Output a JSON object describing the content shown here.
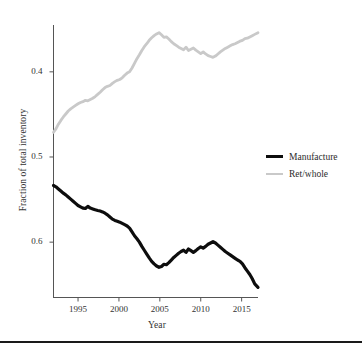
{
  "figure": {
    "background_color": "#ffffff",
    "bottom_rule_color": "#1a1a1a"
  },
  "axes": {
    "y_title": "Fraction of total inventory",
    "x_title": "Year",
    "y_ticks": [
      "0.6",
      "0.5",
      "0.4"
    ],
    "x_ticks": [
      "1995",
      "2000",
      "2005",
      "2010",
      "2015"
    ],
    "axis_color": "#555555"
  },
  "legend": {
    "position": "right",
    "entries": [
      {
        "label": "Manufacture",
        "color": "#0d0d0d"
      },
      {
        "label": "Ret/whole",
        "color": "#c9c9c9"
      }
    ]
  },
  "chart_data": {
    "type": "line",
    "title": "",
    "subtitle": "",
    "xlabel": "Year",
    "ylabel": "Fraction of total inventory",
    "xlim": [
      1992.0,
      2017.0
    ],
    "ylim": [
      0.335,
      0.655
    ],
    "x_ticks": [
      1995,
      2000,
      2005,
      2010,
      2015
    ],
    "y_ticks": [
      0.4,
      0.5,
      0.6
    ],
    "grid": false,
    "legend_position": "right",
    "series": [
      {
        "name": "Manufacture",
        "color": "#0d0d0d",
        "line_width": 3.2,
        "x": [
          1992.0,
          1992.3,
          1992.6,
          1992.9,
          1993.2,
          1993.5,
          1993.8,
          1994.1,
          1994.4,
          1994.7,
          1995.0,
          1995.3,
          1995.6,
          1995.9,
          1996.2,
          1996.5,
          1996.8,
          1997.1,
          1997.4,
          1997.7,
          1998.0,
          1998.3,
          1998.6,
          1998.9,
          1999.2,
          1999.5,
          1999.8,
          2000.1,
          2000.4,
          2000.7,
          2001.0,
          2001.3,
          2001.6,
          2001.9,
          2002.2,
          2002.5,
          2002.8,
          2003.1,
          2003.4,
          2003.7,
          2004.0,
          2004.3,
          2004.6,
          2004.9,
          2005.2,
          2005.5,
          2005.8,
          2006.1,
          2006.4,
          2006.7,
          2007.0,
          2007.3,
          2007.6,
          2007.9,
          2008.2,
          2008.5,
          2008.8,
          2009.1,
          2009.4,
          2009.7,
          2010.0,
          2010.3,
          2010.6,
          2010.9,
          2011.2,
          2011.5,
          2011.8,
          2012.1,
          2012.4,
          2012.7,
          2013.0,
          2013.3,
          2013.6,
          2013.9,
          2014.2,
          2014.5,
          2014.8,
          2015.1,
          2015.4,
          2015.7,
          2016.0,
          2016.3,
          2016.6,
          2017.0
        ],
        "y": [
          0.4665,
          0.465,
          0.4625,
          0.46,
          0.4575,
          0.4555,
          0.453,
          0.4505,
          0.448,
          0.4455,
          0.443,
          0.4415,
          0.44,
          0.4395,
          0.442,
          0.44,
          0.439,
          0.438,
          0.4372,
          0.4365,
          0.4355,
          0.434,
          0.432,
          0.4295,
          0.427,
          0.4255,
          0.4245,
          0.4235,
          0.422,
          0.4205,
          0.419,
          0.4165,
          0.412,
          0.4075,
          0.404,
          0.4,
          0.395,
          0.3905,
          0.386,
          0.3815,
          0.3775,
          0.3745,
          0.372,
          0.3705,
          0.3715,
          0.374,
          0.3735,
          0.376,
          0.379,
          0.382,
          0.3845,
          0.387,
          0.389,
          0.3905,
          0.388,
          0.392,
          0.39,
          0.388,
          0.39,
          0.3925,
          0.3945,
          0.393,
          0.395,
          0.3975,
          0.399,
          0.4005,
          0.399,
          0.3965,
          0.394,
          0.3915,
          0.389,
          0.387,
          0.385,
          0.383,
          0.381,
          0.379,
          0.3775,
          0.3745,
          0.37,
          0.366,
          0.362,
          0.357,
          0.351,
          0.347
        ]
      },
      {
        "name": "Ret/whole",
        "color": "#c9c9c9",
        "line_width": 2.8,
        "x": [
          1992.0,
          1992.3,
          1992.6,
          1992.9,
          1993.2,
          1993.5,
          1993.8,
          1994.1,
          1994.4,
          1994.7,
          1995.0,
          1995.3,
          1995.6,
          1995.9,
          1996.2,
          1996.5,
          1996.8,
          1997.1,
          1997.4,
          1997.7,
          1998.0,
          1998.3,
          1998.6,
          1998.9,
          1999.2,
          1999.5,
          1999.8,
          2000.1,
          2000.4,
          2000.7,
          2001.0,
          2001.3,
          2001.6,
          2001.9,
          2002.2,
          2002.5,
          2002.8,
          2003.1,
          2003.4,
          2003.7,
          2004.0,
          2004.3,
          2004.6,
          2004.9,
          2005.2,
          2005.5,
          2005.8,
          2006.1,
          2006.4,
          2006.7,
          2007.0,
          2007.3,
          2007.6,
          2007.9,
          2008.2,
          2008.5,
          2008.8,
          2009.1,
          2009.4,
          2009.7,
          2010.0,
          2010.3,
          2010.6,
          2010.9,
          2011.2,
          2011.5,
          2011.8,
          2012.1,
          2012.4,
          2012.7,
          2013.0,
          2013.3,
          2013.6,
          2013.9,
          2014.2,
          2014.5,
          2014.8,
          2015.1,
          2015.4,
          2015.7,
          2016.0,
          2016.3,
          2016.6,
          2017.0
        ],
        "y": [
          0.529,
          0.533,
          0.5385,
          0.543,
          0.547,
          0.5505,
          0.554,
          0.5565,
          0.5585,
          0.5605,
          0.5625,
          0.564,
          0.565,
          0.5665,
          0.566,
          0.5675,
          0.569,
          0.571,
          0.5735,
          0.576,
          0.579,
          0.5815,
          0.583,
          0.584,
          0.5865,
          0.5885,
          0.59,
          0.591,
          0.593,
          0.596,
          0.5985,
          0.6,
          0.6045,
          0.61,
          0.6155,
          0.62,
          0.625,
          0.6295,
          0.633,
          0.637,
          0.64,
          0.6425,
          0.6445,
          0.646,
          0.6435,
          0.6405,
          0.641,
          0.6385,
          0.6355,
          0.633,
          0.631,
          0.629,
          0.6275,
          0.626,
          0.629,
          0.625,
          0.6265,
          0.628,
          0.6255,
          0.6235,
          0.6215,
          0.6235,
          0.621,
          0.619,
          0.618,
          0.617,
          0.6185,
          0.621,
          0.6235,
          0.6255,
          0.6275,
          0.629,
          0.6305,
          0.632,
          0.633,
          0.6345,
          0.636,
          0.637,
          0.639,
          0.6395,
          0.641,
          0.6425,
          0.644,
          0.646
        ]
      }
    ]
  }
}
